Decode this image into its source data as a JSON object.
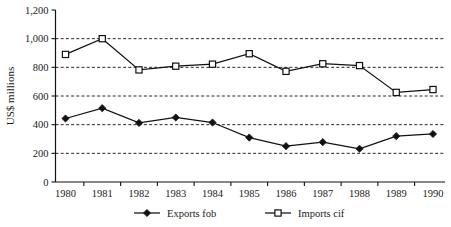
{
  "chart_data": {
    "type": "line",
    "title": "",
    "xlabel": "",
    "ylabel": "US$ millions",
    "categories": [
      "1980",
      "1981",
      "1982",
      "1983",
      "1984",
      "1985",
      "1986",
      "1987",
      "1988",
      "1989",
      "1990"
    ],
    "x": [
      1980,
      1981,
      1982,
      1983,
      1984,
      1985,
      1986,
      1987,
      1988,
      1989,
      1990
    ],
    "ylim": [
      0,
      1200
    ],
    "yticks": [
      0,
      200,
      400,
      600,
      800,
      1000,
      1200
    ],
    "ytick_labels": [
      "0",
      "200",
      "400",
      "600",
      "800",
      "1,000",
      "1,200"
    ],
    "grid": "horizontal-dashed",
    "gridlines_at": [
      200,
      400,
      600,
      800,
      1000
    ],
    "legend_position": "bottom-center",
    "series": [
      {
        "name": "Exports fob",
        "marker": "filled-diamond",
        "values": [
          443,
          515,
          412,
          450,
          415,
          310,
          250,
          278,
          232,
          320,
          335
        ]
      },
      {
        "name": "Imports cif",
        "marker": "open-square",
        "values": [
          890,
          1000,
          782,
          808,
          822,
          895,
          772,
          825,
          812,
          625,
          645
        ]
      }
    ]
  },
  "legend": {
    "items": [
      {
        "label": "Exports fob",
        "marker": "filled-diamond"
      },
      {
        "label": "Imports cif",
        "marker": "open-square"
      }
    ]
  },
  "colors": {
    "background": "#ffffff",
    "ink": "#111111",
    "marker_fill_open": "#ffffff"
  }
}
